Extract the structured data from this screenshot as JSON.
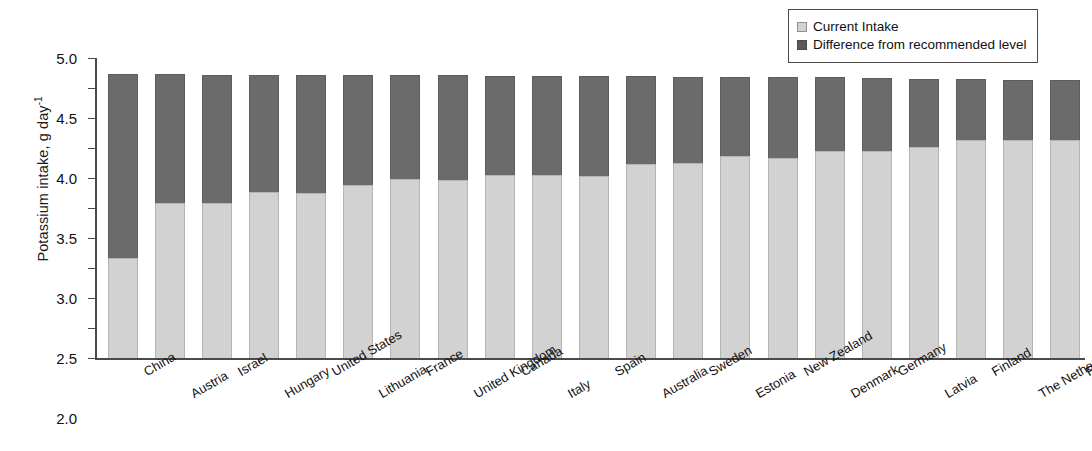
{
  "chart_data": {
    "type": "bar",
    "stacked": true,
    "title": "",
    "xlabel": "",
    "ylabel": "Potassium intake, g day-1",
    "ylabel_base": "Potassium intake, g day",
    "ylabel_exponent": "-1",
    "ylim": [
      0,
      5.0
    ],
    "ytick_step": 0.5,
    "ytick_labels": [
      "5.0",
      "4.5",
      "4.0",
      "3.5",
      "3.0",
      "2.5",
      "2.0",
      "1.5",
      "1.0",
      "0.5",
      "0.0"
    ],
    "ytick_values": [
      5.0,
      4.5,
      4.0,
      3.5,
      3.0,
      2.5,
      2.0,
      1.5,
      1.0,
      0.5,
      0.0
    ],
    "grid": false,
    "legend_position": "top-right",
    "categories": [
      "China",
      "Austria",
      "Israel",
      "Hungary",
      "United States",
      "Lithuania",
      "France",
      "United Kingdom",
      "Canada",
      "Italy",
      "Spain",
      "Australia",
      "Sweden",
      "Estonia",
      "New Zealand",
      "Denmark",
      "Germany",
      "Latvia",
      "Finland",
      "The Netherlands",
      "Poland"
    ],
    "series": [
      {
        "name": "Current Intake",
        "color": "#d2d2d2",
        "values": [
          1.67,
          2.58,
          2.58,
          2.77,
          2.75,
          2.88,
          2.98,
          2.97,
          3.05,
          3.05,
          3.03,
          3.23,
          3.25,
          3.37,
          3.33,
          3.45,
          3.45,
          3.52,
          3.63,
          3.63,
          3.63
        ]
      },
      {
        "name": "Difference from recommended level",
        "color": "#6b6b6b",
        "values": [
          3.06,
          2.15,
          2.13,
          1.94,
          1.96,
          1.83,
          1.73,
          1.74,
          1.65,
          1.65,
          1.67,
          1.47,
          1.44,
          1.32,
          1.35,
          1.23,
          1.22,
          1.13,
          1.02,
          1.01,
          1.01
        ]
      }
    ],
    "totals": [
      4.73,
      4.73,
      4.71,
      4.71,
      4.71,
      4.71,
      4.71,
      4.71,
      4.7,
      4.7,
      4.7,
      4.7,
      4.69,
      4.69,
      4.68,
      4.68,
      4.67,
      4.65,
      4.65,
      4.64,
      4.64
    ]
  },
  "legend": {
    "items": [
      {
        "label": "Current Intake",
        "swatch": "light-gray-square"
      },
      {
        "label": "Difference from recommended level",
        "swatch": "dark-gray-square"
      }
    ]
  },
  "colors": {
    "current_intake": "#d2d2d2",
    "difference": "#6b6b6b",
    "axis": "#4a4a4a",
    "background": "#ffffff"
  }
}
